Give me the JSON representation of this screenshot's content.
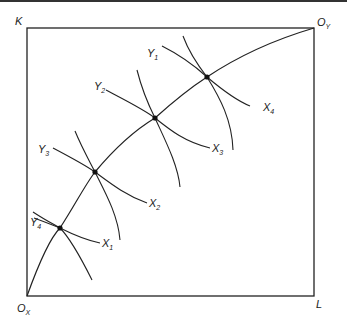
{
  "diagram": {
    "axes": {
      "vertical_label": "K",
      "horizontal_label": "L",
      "origin_x": {
        "main": "O",
        "sub": "X"
      },
      "origin_y": {
        "main": "O",
        "sub": "Y"
      }
    },
    "isoquants_x": [
      {
        "main": "X",
        "sub": "1"
      },
      {
        "main": "X",
        "sub": "2"
      },
      {
        "main": "X",
        "sub": "3"
      },
      {
        "main": "X",
        "sub": "4"
      }
    ],
    "isoquants_y": [
      {
        "main": "Y",
        "sub": "4"
      },
      {
        "main": "Y",
        "sub": "3"
      },
      {
        "main": "Y",
        "sub": "2"
      },
      {
        "main": "Y",
        "sub": "1"
      }
    ],
    "colors": {
      "line": "#222222",
      "background": "#ffffff"
    }
  }
}
